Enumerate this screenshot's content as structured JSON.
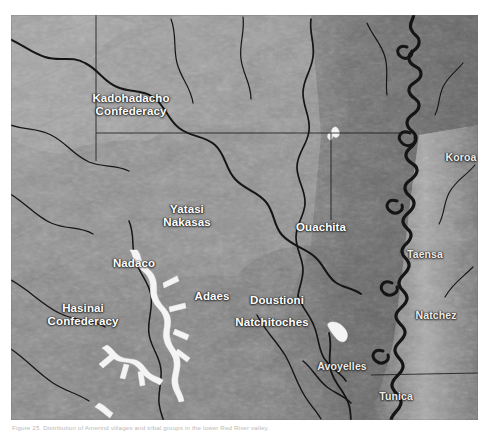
{
  "figure": {
    "caption": "Figure 25. Distribution of Amerind villages and tribal groups in the lower Red River valley.",
    "alt_title": "Shaded relief map of the lower Red River and Mississippi valleys showing Caddoan and Lower Mississippi tribal territories"
  },
  "map": {
    "type": "shaded-relief",
    "background_color": "#8d8d8d",
    "label_color": "#ffffff",
    "water_color": "#f2f2f2",
    "river_color": "#151515",
    "boundary_color": "#1a1a1a",
    "labels": [
      {
        "name": "kadohadacho-confederacy",
        "text": "Kadohadacho\nConfederacy",
        "x": 120,
        "y": 90,
        "size": "lg"
      },
      {
        "name": "yatasi-nakasas",
        "text": "Yatasi\nNakasas",
        "x": 176,
        "y": 201,
        "size": "lg"
      },
      {
        "name": "ouachita",
        "text": "Ouachita",
        "x": 310,
        "y": 212,
        "size": "lg"
      },
      {
        "name": "koroa",
        "text": "Koroa",
        "x": 450,
        "y": 143,
        "size": "md"
      },
      {
        "name": "taensa",
        "text": "Taensa",
        "x": 414,
        "y": 240,
        "size": "md"
      },
      {
        "name": "natchez",
        "text": "Natchez",
        "x": 425,
        "y": 301,
        "size": "md"
      },
      {
        "name": "nadaco",
        "text": "Nadaco",
        "x": 123,
        "y": 248,
        "size": "lg"
      },
      {
        "name": "adaes",
        "text": "Adaes",
        "x": 201,
        "y": 281,
        "size": "lg"
      },
      {
        "name": "doustioni",
        "text": "Doustioni",
        "x": 266,
        "y": 285,
        "size": "lg"
      },
      {
        "name": "natchitoches",
        "text": "Natchitoches",
        "x": 261,
        "y": 307,
        "size": "lg"
      },
      {
        "name": "hasinai-confederacy",
        "text": "Hasinai\nConfederacy",
        "x": 72,
        "y": 300,
        "size": "lg"
      },
      {
        "name": "avoyelles",
        "text": "Avoyelles",
        "x": 331,
        "y": 352,
        "size": "md"
      },
      {
        "name": "tunica",
        "text": "Tunica",
        "x": 385,
        "y": 382,
        "size": "md"
      }
    ]
  }
}
